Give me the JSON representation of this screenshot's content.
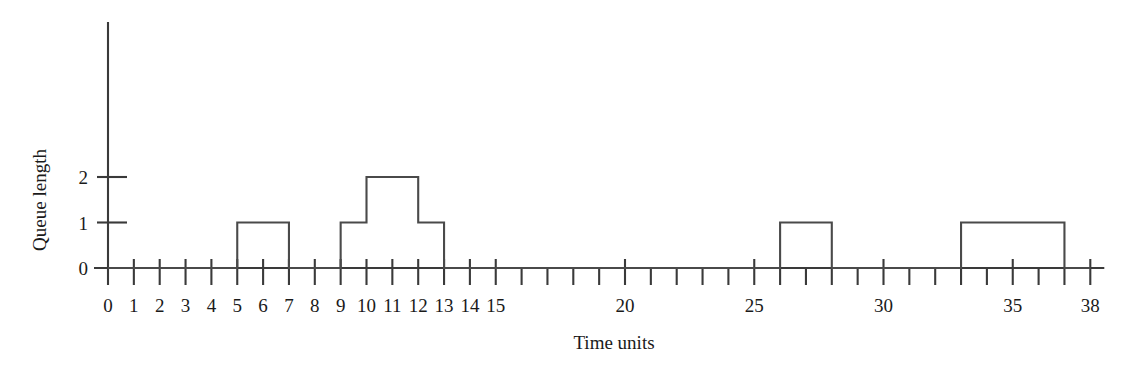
{
  "chart_data": {
    "type": "line",
    "subtype": "step-post",
    "title": "",
    "xlabel": "Time units",
    "ylabel": "Queue length",
    "xlim": [
      0,
      38
    ],
    "ylim": [
      0,
      2
    ],
    "grid": false,
    "legend": null,
    "x_tick_values": [
      0,
      1,
      2,
      3,
      4,
      5,
      6,
      7,
      8,
      9,
      10,
      11,
      12,
      13,
      14,
      15,
      16,
      17,
      18,
      19,
      20,
      21,
      22,
      23,
      24,
      25,
      26,
      27,
      28,
      29,
      30,
      31,
      32,
      33,
      34,
      35,
      36,
      37,
      38
    ],
    "x_tick_labels": [
      {
        "value": 0,
        "label": "0"
      },
      {
        "value": 1,
        "label": "1"
      },
      {
        "value": 2,
        "label": "2"
      },
      {
        "value": 3,
        "label": "3"
      },
      {
        "value": 4,
        "label": "4"
      },
      {
        "value": 5,
        "label": "5"
      },
      {
        "value": 6,
        "label": "6"
      },
      {
        "value": 7,
        "label": "7"
      },
      {
        "value": 8,
        "label": "8"
      },
      {
        "value": 9,
        "label": "9"
      },
      {
        "value": 10,
        "label": "10"
      },
      {
        "value": 11,
        "label": "11"
      },
      {
        "value": 12,
        "label": "12"
      },
      {
        "value": 13,
        "label": "13"
      },
      {
        "value": 14,
        "label": "14"
      },
      {
        "value": 15,
        "label": "15"
      },
      {
        "value": 20,
        "label": "20"
      },
      {
        "value": 25,
        "label": "25"
      },
      {
        "value": 30,
        "label": "30"
      },
      {
        "value": 35,
        "label": "35"
      },
      {
        "value": 38,
        "label": "38"
      }
    ],
    "y_tick_labels": [
      {
        "value": 0,
        "label": "0"
      },
      {
        "value": 1,
        "label": "1"
      },
      {
        "value": 2,
        "label": "2"
      }
    ],
    "series": [
      {
        "name": "Queue length",
        "color": "#4a4a4a",
        "step_intervals": [
          {
            "start": 0,
            "end": 5,
            "value": 0
          },
          {
            "start": 5,
            "end": 7,
            "value": 1
          },
          {
            "start": 7,
            "end": 9,
            "value": 0
          },
          {
            "start": 9,
            "end": 10,
            "value": 1
          },
          {
            "start": 10,
            "end": 12,
            "value": 2
          },
          {
            "start": 12,
            "end": 13,
            "value": 1
          },
          {
            "start": 13,
            "end": 26,
            "value": 0
          },
          {
            "start": 26,
            "end": 28,
            "value": 1
          },
          {
            "start": 28,
            "end": 33,
            "value": 0
          },
          {
            "start": 33,
            "end": 37,
            "value": 1
          },
          {
            "start": 37,
            "end": 38,
            "value": 0
          }
        ],
        "points": [
          {
            "x": 0,
            "y": 0
          },
          {
            "x": 5,
            "y": 0
          },
          {
            "x": 5,
            "y": 1
          },
          {
            "x": 7,
            "y": 1
          },
          {
            "x": 7,
            "y": 0
          },
          {
            "x": 9,
            "y": 0
          },
          {
            "x": 9,
            "y": 1
          },
          {
            "x": 10,
            "y": 1
          },
          {
            "x": 10,
            "y": 2
          },
          {
            "x": 12,
            "y": 2
          },
          {
            "x": 12,
            "y": 1
          },
          {
            "x": 13,
            "y": 1
          },
          {
            "x": 13,
            "y": 0
          },
          {
            "x": 26,
            "y": 0
          },
          {
            "x": 26,
            "y": 1
          },
          {
            "x": 28,
            "y": 1
          },
          {
            "x": 28,
            "y": 0
          },
          {
            "x": 33,
            "y": 0
          },
          {
            "x": 33,
            "y": 1
          },
          {
            "x": 37,
            "y": 1
          },
          {
            "x": 37,
            "y": 0
          },
          {
            "x": 38,
            "y": 0
          }
        ]
      }
    ],
    "colors": {
      "axis": "#3a3a3a",
      "line": "#4a4a4a",
      "text": "#1a1a1a",
      "background": "#ffffff"
    }
  }
}
